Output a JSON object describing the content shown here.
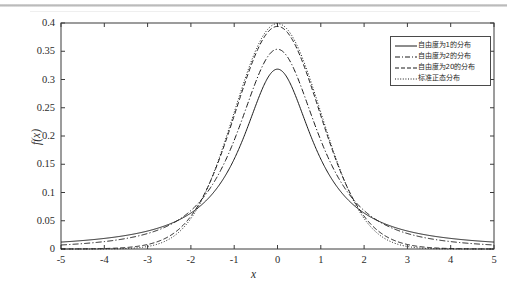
{
  "chart_data": {
    "type": "line",
    "title": "",
    "xlabel": "x",
    "ylabel": "f(x)",
    "xlim": [
      -5,
      5
    ],
    "ylim": [
      0,
      0.4
    ],
    "xticks": [
      "-5",
      "-4",
      "-3",
      "-2",
      "-1",
      "0",
      "1",
      "2",
      "3",
      "4",
      "5"
    ],
    "xtick_values": [
      -5,
      -4,
      -3,
      -2,
      -1,
      0,
      1,
      2,
      3,
      4,
      5
    ],
    "yticks": [
      "0",
      "0.05",
      "0.1",
      "0.15",
      "0.2",
      "0.25",
      "0.3",
      "0.35",
      "0.4"
    ],
    "ytick_values": [
      0,
      0.05,
      0.1,
      0.15,
      0.2,
      0.25,
      0.3,
      0.35,
      0.4
    ],
    "grid": false,
    "legend_position": "top-right",
    "series": [
      {
        "name": "自由度为1的分布",
        "distribution": "t",
        "df": 1,
        "linestyle": "solid",
        "color": "#1a1a1a",
        "peak_value": 0.318,
        "x": [
          -5,
          -4.5,
          -4,
          -3.5,
          -3,
          -2.5,
          -2,
          -1.5,
          -1,
          -0.5,
          0,
          0.5,
          1,
          1.5,
          2,
          2.5,
          3,
          3.5,
          4,
          4.5,
          5
        ],
        "y": [
          0.012,
          0.015,
          0.019,
          0.025,
          0.032,
          0.044,
          0.064,
          0.098,
          0.159,
          0.255,
          0.318,
          0.255,
          0.159,
          0.098,
          0.064,
          0.044,
          0.032,
          0.025,
          0.019,
          0.015,
          0.012
        ]
      },
      {
        "name": "自由度为2的分布",
        "distribution": "t",
        "df": 2,
        "linestyle": "dashdot",
        "color": "#1a1a1a",
        "peak_value": 0.354,
        "x": [
          -5,
          -4.5,
          -4,
          -3.5,
          -3,
          -2.5,
          -2,
          -1.5,
          -1,
          -0.5,
          0,
          0.5,
          1,
          1.5,
          2,
          2.5,
          3,
          3.5,
          4,
          4.5,
          5
        ],
        "y": [
          0.007,
          0.009,
          0.013,
          0.019,
          0.027,
          0.042,
          0.068,
          0.114,
          0.192,
          0.296,
          0.354,
          0.296,
          0.192,
          0.114,
          0.068,
          0.042,
          0.027,
          0.019,
          0.013,
          0.009,
          0.007
        ]
      },
      {
        "name": "自由度为20的分布",
        "distribution": "t",
        "df": 20,
        "linestyle": "dashed",
        "color": "#1a1a1a",
        "peak_value": 0.394,
        "x": [
          -5,
          -4.5,
          -4,
          -3.5,
          -3,
          -2.5,
          -2,
          -1.5,
          -1,
          -0.5,
          0,
          0.5,
          1,
          1.5,
          2,
          2.5,
          3,
          3.5,
          4,
          4.5,
          5
        ],
        "y": [
          0.0003,
          0.0006,
          0.0013,
          0.0029,
          0.0063,
          0.0147,
          0.0335,
          0.0724,
          0.1361,
          0.2408,
          0.394,
          0.2408,
          0.1361,
          0.0724,
          0.0335,
          0.0147,
          0.0063,
          0.0029,
          0.0013,
          0.0006,
          0.0003
        ]
      },
      {
        "name": "标准正态分布",
        "distribution": "normal",
        "mu": 0,
        "sigma": 1,
        "linestyle": "dotted",
        "color": "#1a1a1a",
        "peak_value": 0.399,
        "x": [
          -5,
          -4.5,
          -4,
          -3.5,
          -3,
          -2.5,
          -2,
          -1.5,
          -1,
          -0.5,
          0,
          0.5,
          1,
          1.5,
          2,
          2.5,
          3,
          3.5,
          4,
          4.5,
          5
        ],
        "y": [
          1.5e-06,
          1.6e-05,
          0.000134,
          0.000873,
          0.004432,
          0.017528,
          0.053991,
          0.129518,
          0.241971,
          0.352065,
          0.398942,
          0.352065,
          0.241971,
          0.129518,
          0.053991,
          0.017528,
          0.004432,
          0.000873,
          0.000134,
          1.6e-05,
          1.5e-06
        ]
      }
    ],
    "annotations": []
  },
  "axes": {
    "x_title": "x",
    "y_title": "f(x)"
  },
  "legend": {
    "entries": [
      {
        "label": "自由度为1的分布",
        "style": "solid"
      },
      {
        "label": "自由度为2的分布",
        "style": "dashdot"
      },
      {
        "label": "自由度为20的分布",
        "style": "dashed"
      },
      {
        "label": "标准正态分布",
        "style": "dotted"
      }
    ]
  }
}
